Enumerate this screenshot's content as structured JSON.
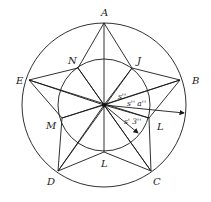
{
  "diagram": {
    "center": {
      "x": 104,
      "y": 105
    },
    "outer_radius": 82,
    "inner_radius": 46,
    "outer_points": {
      "A": {
        "x": 104,
        "y": 23,
        "label": "A"
      },
      "B": {
        "x": 180,
        "y": 80,
        "label": "B"
      },
      "C": {
        "x": 151,
        "y": 171,
        "label": "C"
      },
      "D": {
        "x": 58,
        "y": 171,
        "label": "D"
      },
      "E": {
        "x": 29,
        "y": 80,
        "label": "E"
      }
    },
    "inner_points": {
      "N": {
        "x": 78,
        "y": 68,
        "label": "N"
      },
      "J": {
        "x": 132,
        "y": 68,
        "label": "J"
      },
      "L_right": {
        "x": 149,
        "y": 118,
        "label": "L"
      },
      "L_bottom": {
        "x": 104,
        "y": 152,
        "label": "L"
      },
      "M": {
        "x": 62,
        "y": 118,
        "label": "M"
      }
    },
    "angle_labels": {
      "top": "s''",
      "middle": "s'' a''",
      "bottom": "s' 3''"
    },
    "stroke_color": "#1a1a1a"
  }
}
